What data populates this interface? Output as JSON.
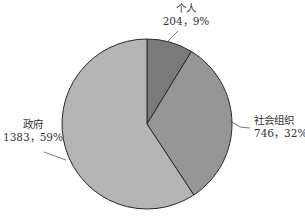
{
  "chart_data": {
    "type": "pie",
    "title": "",
    "categories": [
      "个人",
      "社会组织",
      "政府"
    ],
    "values": [
      204,
      746,
      1383
    ],
    "percentages": [
      9,
      32,
      59
    ],
    "labels": [
      "204，9%",
      "746，32%",
      "1383，59%"
    ],
    "colors": [
      "#7a7a7a",
      "#969696",
      "#b4b4b4"
    ],
    "start_angle_deg": 0,
    "direction": "clockwise",
    "legend": "none",
    "data_labels": "outside with leader lines"
  },
  "labels": {
    "geren_name": "个人",
    "geren_value": "204，9%",
    "shehui_name": "社会组织",
    "shehui_value": "746，32%",
    "zhengfu_name": "政府",
    "zhengfu_value": "1383，59%"
  }
}
